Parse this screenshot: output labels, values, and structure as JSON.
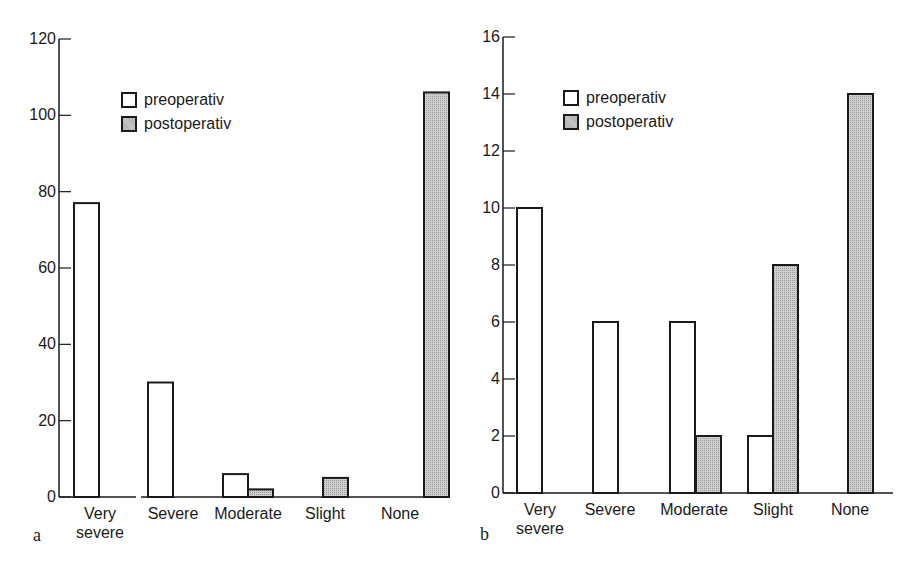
{
  "legend": {
    "items": [
      {
        "label": "preoperativ",
        "fill": "#ffffff"
      },
      {
        "label": "postoperativ",
        "fill": "#c9c9c9"
      }
    ]
  },
  "panels": [
    {
      "letter": "a",
      "yticks": [
        "0",
        "20",
        "40",
        "60",
        "80",
        "100",
        "120"
      ]
    },
    {
      "letter": "b",
      "yticks": [
        "0",
        "2",
        "4",
        "6",
        "8",
        "10",
        "12",
        "14",
        "16"
      ]
    }
  ],
  "categories": [
    {
      "line1": "Very",
      "line2": "severe"
    },
    {
      "line1": "Severe",
      "line2": ""
    },
    {
      "line1": "Moderate",
      "line2": ""
    },
    {
      "line1": "Slight",
      "line2": ""
    },
    {
      "line1": "None",
      "line2": ""
    }
  ],
  "chart_data": [
    {
      "type": "bar",
      "title": "",
      "panel_label": "a",
      "xlabel": "",
      "ylabel": "",
      "categories": [
        "Very severe",
        "Severe",
        "Moderate",
        "Slight",
        "None"
      ],
      "series": [
        {
          "name": "preoperativ",
          "values": [
            77,
            30,
            6,
            0,
            0
          ]
        },
        {
          "name": "postoperativ",
          "values": [
            0,
            0,
            2,
            5,
            106
          ]
        }
      ],
      "ylim": [
        0,
        120
      ],
      "yticks": [
        0,
        20,
        40,
        60,
        80,
        100,
        120
      ],
      "grid": false,
      "legend_position": "upper left (inside)"
    },
    {
      "type": "bar",
      "title": "",
      "panel_label": "b",
      "xlabel": "",
      "ylabel": "",
      "categories": [
        "Very severe",
        "Severe",
        "Moderate",
        "Slight",
        "None"
      ],
      "series": [
        {
          "name": "preoperativ",
          "values": [
            10,
            6,
            6,
            2,
            0
          ]
        },
        {
          "name": "postoperativ",
          "values": [
            0,
            0,
            2,
            8,
            14
          ]
        }
      ],
      "ylim": [
        0,
        16
      ],
      "yticks": [
        0,
        2,
        4,
        6,
        8,
        10,
        12,
        14,
        16
      ],
      "grid": false,
      "legend_position": "upper left (inside)"
    }
  ]
}
